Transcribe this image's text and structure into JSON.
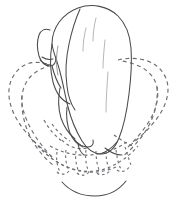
{
  "figure": {
    "title": "Closed fist with dashed open-hand overlay",
    "caption": "",
    "background_color": "#ffffff",
    "solid_line_color": "#4a4a4a",
    "faint_line_color": "#a9a9ad",
    "dashed_line_color": "#6d6d72",
    "canvas": {
      "width": 178,
      "height": 205
    },
    "parts": [
      {
        "id": "fist-outline",
        "label": "Clenched fist outline",
        "style": "solid"
      },
      {
        "id": "thumb",
        "label": "Thumb folded across the side",
        "style": "solid"
      },
      {
        "id": "knuckle-creases",
        "label": "Knuckle and finger crease contours",
        "style": "faint-solid"
      },
      {
        "id": "open-hand-ghost",
        "label": "Dashed ghost outline of open spread hand",
        "style": "dashed"
      },
      {
        "id": "ghost-fingers",
        "label": "Dashed splayed finger outlines",
        "style": "dashed"
      },
      {
        "id": "wrist-arc",
        "label": "Wrist base arc",
        "style": "solid"
      }
    ]
  }
}
